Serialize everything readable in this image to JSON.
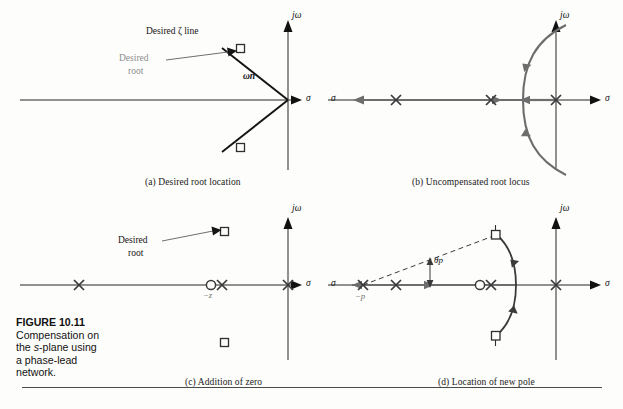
{
  "figure": {
    "number": "FIGURE 10.11",
    "caption_line1": "Compensation on",
    "caption_line2_pre": "the ",
    "caption_line2_italic": "s",
    "caption_line2_post": "-plane using",
    "caption_line3": "a phase-lead",
    "caption_line4": "network."
  },
  "axes": {
    "imaginary_label": "jω",
    "real_label": "σ"
  },
  "panels": [
    {
      "id": "a",
      "caption": "(a)  Desired root location",
      "annotations": {
        "zeta_line": "Desired ζ line",
        "desired_root_line1": "Desired",
        "desired_root_line2": "root",
        "omega_n": "ωn"
      },
      "markers": {
        "desired_roots": [
          {
            "type": "square",
            "x": -0.52,
            "y": 0.62
          },
          {
            "type": "square",
            "x": -0.52,
            "y": -0.62
          }
        ]
      }
    },
    {
      "id": "b",
      "caption": "(b)  Uncompensated root locus",
      "markers": {
        "poles": [
          {
            "type": "cross",
            "x": -4.1,
            "y": 0
          },
          {
            "type": "cross",
            "x": -1.1,
            "y": 0
          },
          {
            "type": "cross",
            "x": 0.0,
            "y": 0
          }
        ]
      },
      "locus": {
        "breakaway_x": -0.62,
        "direction_arrows": 5
      }
    },
    {
      "id": "c",
      "caption": "(c)  Addition of zero",
      "annotations": {
        "desired_root_line1": "Desired",
        "desired_root_line2": "root",
        "zero_label": "−z"
      },
      "markers": {
        "poles": [
          {
            "type": "cross",
            "x": -4.1,
            "y": 0
          },
          {
            "type": "cross",
            "x": -1.05,
            "y": 0
          },
          {
            "type": "cross",
            "x": 0.0,
            "y": 0
          }
        ],
        "zeros": [
          {
            "type": "circle",
            "x": -1.32,
            "y": 0
          }
        ],
        "desired_roots": [
          {
            "type": "square",
            "x": -0.95,
            "y": 0.7
          },
          {
            "type": "square",
            "x": -0.95,
            "y": -0.7
          }
        ]
      }
    },
    {
      "id": "d",
      "caption": "(d)  Location of new pole",
      "annotations": {
        "pole_label": "−p",
        "theta_label": "θp"
      },
      "markers": {
        "poles": [
          {
            "type": "cross",
            "x": -4.55,
            "y": 0
          },
          {
            "type": "cross",
            "x": -3.55,
            "y": 0
          },
          {
            "type": "cross",
            "x": -1.05,
            "y": 0
          },
          {
            "type": "cross",
            "x": 0.0,
            "y": 0
          }
        ],
        "zeros": [
          {
            "type": "circle",
            "x": -1.32,
            "y": 0
          }
        ],
        "desired_roots": [
          {
            "type": "square",
            "x": -0.95,
            "y": 0.7
          },
          {
            "type": "square",
            "x": -0.95,
            "y": -0.7
          }
        ]
      },
      "locus": {
        "direction_arrows": 2
      }
    }
  ],
  "colors": {
    "axis": "#6d6d6d",
    "locus": "#6d6d6d",
    "marker": "#3a3a3a",
    "annotation_black": "#141414",
    "annotation_gray": "#8d8d8d",
    "rule": "#4a4a4a"
  }
}
